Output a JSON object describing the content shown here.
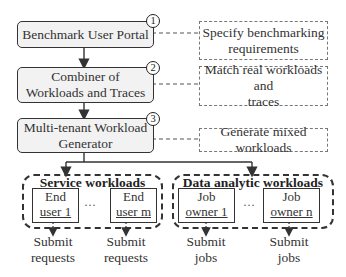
{
  "stages": [
    {
      "label": "Benchmark User Portal",
      "step": "1"
    },
    {
      "label": "Combiner of Workloads and Traces",
      "line1": "Combiner of",
      "line2": "Workloads and Traces",
      "step": "2"
    },
    {
      "label": "Multi-tenant Workload Generator",
      "line1": "Multi-tenant Workload",
      "line2": "Generator",
      "step": "3"
    }
  ],
  "notes": [
    {
      "line1": "Specify benchmarking",
      "line2": "requirements"
    },
    {
      "line1": "Match real workloads and",
      "line2": "traces"
    },
    {
      "line1": "Generate mixed workloads"
    }
  ],
  "groups": [
    {
      "title": "Service workloads",
      "actors": [
        {
          "line1": "End",
          "line2": "user 1",
          "output1": "Submit",
          "output2": "requests"
        },
        {
          "line1": "End",
          "line2": "user m",
          "output1": "Submit",
          "output2": "requests"
        }
      ],
      "ellipsis": "…"
    },
    {
      "title": "Data analytic workloads",
      "actors": [
        {
          "line1": "Job",
          "line2": "owner 1",
          "output1": "Submit",
          "output2": "jobs"
        },
        {
          "line1": "Job",
          "line2": "owner n",
          "output1": "Submit",
          "output2": "jobs"
        }
      ],
      "ellipsis": "…"
    }
  ],
  "colors": {
    "stage_fill": "#f2f2f2",
    "stroke": "#333333",
    "note_border": "#777777"
  }
}
